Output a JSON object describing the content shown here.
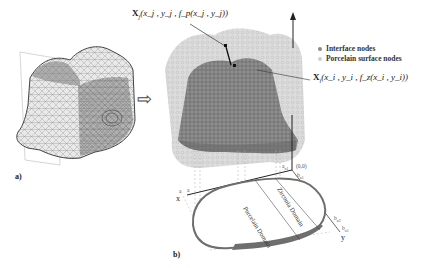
{
  "figure": {
    "panel_a_label": "a)",
    "panel_b_label": "b)",
    "arrow_symbol": "⇨",
    "equations": {
      "porcelain_point": "X_j(x_j, y_j, f_p(x_j, y_j))",
      "porcelain_prefix": "X",
      "porcelain_sub": "j",
      "porcelain_args": "(x_j , y_j , f_p(x_j , y_j)",
      "porcelain_close": ")",
      "interface_point": "X_i(x_i, y_i, f_z(x_i, y_i))",
      "interface_prefix": "X",
      "interface_sub": "i",
      "interface_args": "(x_i , y_i , f_z(x_i , y_i)",
      "interface_close": ")"
    },
    "legend": {
      "items": [
        {
          "label": "Interface  nodes",
          "color": "#8a8a8a"
        },
        {
          "label": "Porcelain surface nodes",
          "color": "#cfcfcf"
        }
      ]
    },
    "axes": {
      "x_label": "x",
      "y_label": "y",
      "origin_label": "(0,0)",
      "a_top": "a",
      "a_top_sub": "n1",
      "b_top": "b",
      "b_top_sub": "n1",
      "a_left": "a",
      "a_left2": "a",
      "b_right1": "b",
      "b_right1_sub": "n2",
      "b_right2": "b",
      "b_right2_sub": "n1"
    },
    "domains": {
      "porcelain": "Porcelain Domain",
      "zirconia": "Zirconia Domain"
    },
    "colors": {
      "mesh_dark": "#5a5a5a",
      "mesh_light": "#bdbdbd",
      "porcelain_cloud": "#cfcfcf",
      "interface_cloud": "#7c7c7c",
      "domain_band": "#6e6e6e"
    }
  }
}
